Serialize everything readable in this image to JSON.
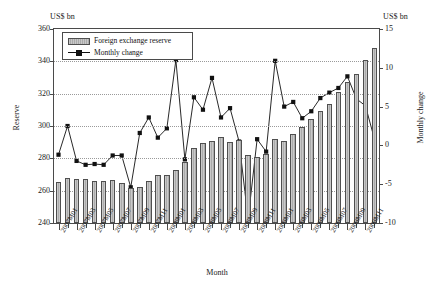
{
  "chart_data": {
    "type": "bar",
    "title": "",
    "xlabel": "Month",
    "ylabel": "Reserve",
    "y2label": "Monthly change",
    "unit_left": "US$ bn",
    "unit_right": "US$ bn",
    "ylim": [
      240,
      360
    ],
    "y2lim": [
      -10,
      15
    ],
    "yticks": [
      240,
      260,
      280,
      300,
      320,
      340,
      360
    ],
    "y2ticks": [
      -10,
      -5,
      0,
      5,
      10,
      15
    ],
    "grid": true,
    "legend_position": "top-left",
    "categories": [
      "2007M01",
      "2007M02",
      "2007M03",
      "2007M04",
      "2007M05",
      "2007M06",
      "2007M07",
      "2007M08",
      "2007M09",
      "2007M10",
      "2007M11",
      "2007M12",
      "2008M01",
      "2008M02",
      "2008M03",
      "2008M04",
      "2008M05",
      "2008M06",
      "2008M07",
      "2008M08",
      "2008M09",
      "2008M10",
      "2008M11",
      "2008M12",
      "2009M01",
      "2009M02",
      "2009M03",
      "2009M04",
      "2009M05",
      "2009M06",
      "2009M07",
      "2009M08",
      "2009M09",
      "2009M10",
      "2009M11",
      "2009M12"
    ],
    "tick_labels": [
      "2007M01",
      "2007M03",
      "2007M05",
      "2007M07",
      "2007M09",
      "2007M11",
      "2008M01",
      "2008M03",
      "2008M05",
      "2008M07",
      "2008M09",
      "2008M11",
      "2009M01",
      "2009M03",
      "2009M05",
      "2009M07",
      "2009M09",
      "2009M11"
    ],
    "series": [
      {
        "name": "Foreign exchange reserve",
        "axis": "left",
        "kind": "bar",
        "color": "#b8b8b8",
        "values": [
          265.5,
          268.0,
          267.5,
          267.0,
          265.8,
          265.8,
          266.3,
          264.5,
          261.5,
          262.5,
          265.8,
          270.0,
          270.0,
          273.0,
          278.0,
          286.5,
          289.5,
          291.0,
          293.5,
          290.0,
          291.5,
          282.0,
          281.0,
          282.5,
          292.0,
          291.0,
          295.0,
          299.5,
          304.5,
          309.5,
          313.5,
          321.0,
          327.0,
          332.0,
          341.0,
          348.0
        ]
      },
      {
        "name": "Monthly change",
        "axis": "right",
        "kind": "line",
        "color": "#111111",
        "marker": "square",
        "values": [
          -1.2,
          2.5,
          -2.0,
          -2.5,
          -2.4,
          -2.5,
          -1.3,
          -1.3,
          -5.4,
          1.6,
          3.6,
          1.0,
          2.2,
          11.0,
          -1.8,
          6.2,
          4.6,
          8.7,
          3.6,
          4.8,
          0.5,
          -9.5,
          0.8,
          -0.8,
          10.9,
          5.0,
          5.6,
          3.5,
          4.4,
          6.1,
          6.8,
          7.4,
          8.9,
          6.0,
          5.1,
          0.8
        ]
      }
    ]
  },
  "legend": {
    "items": [
      {
        "label": "Foreign exchange reserve",
        "type": "bar"
      },
      {
        "label": "Monthly change",
        "type": "line"
      }
    ]
  }
}
